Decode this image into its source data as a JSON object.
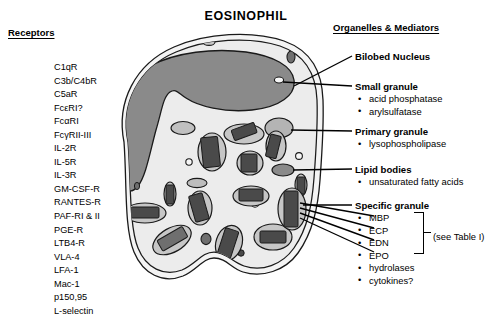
{
  "title": "EOSINOPHIL",
  "left_column": {
    "heading": "Receptors",
    "items": [
      "C1qR",
      "C3b/C4bR",
      "C5aR",
      "FcεRI?",
      "FcαRI",
      "FcγRII-III",
      "IL-2R",
      "IL-5R",
      "IL-3R",
      "GM-CSF-R",
      "RANTES-R",
      "PAF-RI & II",
      "PGE-R",
      "LTB4-R",
      "VLA-4",
      "LFA-1",
      "Mac-1",
      "p150,95",
      "L-selectin"
    ]
  },
  "right_column": {
    "heading": "Organelles & Mediators",
    "groups": [
      {
        "label": "Bilobed Nucleus",
        "items": []
      },
      {
        "label": "Small granule",
        "items": [
          "acid phosphatase",
          "arylsulfatase"
        ]
      },
      {
        "label": "Primary granule",
        "items": [
          "lysophospholipase"
        ]
      },
      {
        "label": "Lipid bodies",
        "items": [
          "unsaturated fatty acids"
        ]
      },
      {
        "label": "Specific granule",
        "items": [
          "MBP",
          "ECP",
          "EDN",
          "EPO",
          "hydrolases",
          "cytokines?"
        ]
      }
    ],
    "table_note": "(see Table I)"
  },
  "figure": {
    "name": "eosinophil-cell-diagram",
    "colors": {
      "membrane_rim": "#f4f4f4",
      "cytoplasm": "#ececec",
      "nucleus": "#8a8a8a",
      "granule_matrix": "#c6c6c6",
      "crystalloid_core": "#4a4a4a",
      "lipid_body": "#8a8a8a",
      "outline": "#1a1a1a"
    }
  }
}
